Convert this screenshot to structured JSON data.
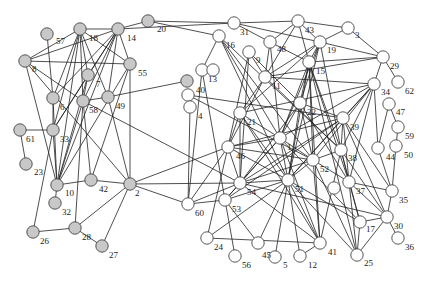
{
  "diagram": {
    "type": "network-graph",
    "colors": {
      "group_a": "#c8c8c8",
      "group_b": "#ffffff",
      "edge": "#222222"
    },
    "nodes": [
      {
        "id": "57",
        "x": 47,
        "y": 34,
        "group": "a",
        "lx": 56,
        "ly": 44
      },
      {
        "id": "18",
        "x": 80,
        "y": 29,
        "group": "a",
        "lx": 89,
        "ly": 41
      },
      {
        "id": "14",
        "x": 118,
        "y": 29,
        "group": "a",
        "lx": 127,
        "ly": 41
      },
      {
        "id": "20",
        "x": 148,
        "y": 21,
        "group": "a",
        "lx": 157,
        "ly": 32
      },
      {
        "id": "8",
        "x": 25,
        "y": 61,
        "group": "a",
        "lx": 32,
        "ly": 72
      },
      {
        "id": "55",
        "x": 130,
        "y": 64,
        "group": "a",
        "lx": 138,
        "ly": 76
      },
      {
        "id": "7",
        "x": 88,
        "y": 75,
        "group": "a",
        "lx": 96,
        "ly": 87
      },
      {
        "id": "6",
        "x": 53,
        "y": 98,
        "group": "a",
        "lx": 60,
        "ly": 110
      },
      {
        "id": "58",
        "x": 83,
        "y": 101,
        "group": "a",
        "lx": 89,
        "ly": 113
      },
      {
        "id": "49",
        "x": 108,
        "y": 97,
        "group": "a",
        "lx": 116,
        "ly": 109
      },
      {
        "id": "61",
        "x": 20,
        "y": 130,
        "group": "a",
        "lx": 26,
        "ly": 142
      },
      {
        "id": "33",
        "x": 53,
        "y": 130,
        "group": "a",
        "lx": 60,
        "ly": 142
      },
      {
        "id": "23",
        "x": 26,
        "y": 164,
        "group": "a",
        "lx": 34,
        "ly": 175
      },
      {
        "id": "10",
        "x": 57,
        "y": 185,
        "group": "a",
        "lx": 65,
        "ly": 196
      },
      {
        "id": "42",
        "x": 91,
        "y": 180,
        "group": "a",
        "lx": 99,
        "ly": 192
      },
      {
        "id": "2",
        "x": 130,
        "y": 184,
        "group": "a",
        "lx": 135,
        "ly": 196
      },
      {
        "id": "32",
        "x": 55,
        "y": 203,
        "group": "a",
        "lx": 62,
        "ly": 215
      },
      {
        "id": "26",
        "x": 33,
        "y": 232,
        "group": "a",
        "lx": 40,
        "ly": 244
      },
      {
        "id": "28",
        "x": 75,
        "y": 228,
        "group": "a",
        "lx": 82,
        "ly": 240
      },
      {
        "id": "27",
        "x": 102,
        "y": 246,
        "group": "a",
        "lx": 109,
        "ly": 258
      },
      {
        "id": "19b",
        "x": 187,
        "y": 81,
        "group": "a",
        "lx": 0,
        "ly": 0,
        "hidden_label": true
      },
      {
        "id": "31",
        "x": 234,
        "y": 23,
        "group": "b",
        "lx": 240,
        "ly": 35
      },
      {
        "id": "43",
        "x": 298,
        "y": 21,
        "group": "b",
        "lx": 305,
        "ly": 33
      },
      {
        "id": "3",
        "x": 348,
        "y": 28,
        "group": "b",
        "lx": 355,
        "ly": 38
      },
      {
        "id": "16",
        "x": 219,
        "y": 36,
        "group": "b",
        "lx": 226,
        "ly": 48
      },
      {
        "id": "48",
        "x": 270,
        "y": 42,
        "group": "b",
        "lx": 277,
        "ly": 52
      },
      {
        "id": "19",
        "x": 320,
        "y": 42,
        "group": "b",
        "lx": 327,
        "ly": 53
      },
      {
        "id": "9",
        "x": 249,
        "y": 52,
        "group": "b",
        "lx": 256,
        "ly": 63
      },
      {
        "id": "15",
        "x": 309,
        "y": 62,
        "group": "b",
        "lx": 316,
        "ly": 74
      },
      {
        "id": "29",
        "x": 383,
        "y": 57,
        "group": "b",
        "lx": 390,
        "ly": 69
      },
      {
        "id": "13",
        "x": 202,
        "y": 70,
        "group": "b",
        "lx": 208,
        "ly": 82
      },
      {
        "id": "11",
        "x": 265,
        "y": 77,
        "group": "b",
        "lx": 272,
        "ly": 89
      },
      {
        "id": "62",
        "x": 398,
        "y": 82,
        "group": "b",
        "lx": 405,
        "ly": 94
      },
      {
        "id": "40",
        "x": 188,
        "y": 95,
        "group": "b",
        "lx": 196,
        "ly": 93
      },
      {
        "id": "4",
        "x": 190,
        "y": 107,
        "group": "b",
        "lx": 198,
        "ly": 119
      },
      {
        "id": "34",
        "x": 374,
        "y": 84,
        "group": "b",
        "lx": 381,
        "ly": 95
      },
      {
        "id": "47",
        "x": 389,
        "y": 104,
        "group": "b",
        "lx": 396,
        "ly": 115
      },
      {
        "id": "21",
        "x": 240,
        "y": 113,
        "group": "b",
        "lx": 247,
        "ly": 125
      },
      {
        "id": "22",
        "x": 300,
        "y": 103,
        "group": "b",
        "lx": 307,
        "ly": 115
      },
      {
        "id": "39",
        "x": 343,
        "y": 118,
        "group": "b",
        "lx": 350,
        "ly": 130
      },
      {
        "id": "59",
        "x": 398,
        "y": 127,
        "group": "b",
        "lx": 405,
        "ly": 139
      },
      {
        "id": "1",
        "x": 280,
        "y": 138,
        "group": "b",
        "lx": 287,
        "ly": 150
      },
      {
        "id": "46",
        "x": 228,
        "y": 147,
        "group": "b",
        "lx": 236,
        "ly": 159
      },
      {
        "id": "38",
        "x": 341,
        "y": 150,
        "group": "b",
        "lx": 348,
        "ly": 161
      },
      {
        "id": "44",
        "x": 378,
        "y": 148,
        "group": "b",
        "lx": 386,
        "ly": 160
      },
      {
        "id": "50",
        "x": 396,
        "y": 146,
        "group": "b",
        "lx": 404,
        "ly": 158
      },
      {
        "id": "52",
        "x": 313,
        "y": 160,
        "group": "b",
        "lx": 320,
        "ly": 172
      },
      {
        "id": "54",
        "x": 240,
        "y": 183,
        "group": "b",
        "lx": 247,
        "ly": 195
      },
      {
        "id": "51",
        "x": 288,
        "y": 180,
        "group": "b",
        "lx": 295,
        "ly": 192
      },
      {
        "id": "37",
        "x": 349,
        "y": 182,
        "group": "b",
        "lx": 356,
        "ly": 194
      },
      {
        "id": "60",
        "x": 188,
        "y": 204,
        "group": "b",
        "lx": 195,
        "ly": 216
      },
      {
        "id": "53",
        "x": 225,
        "y": 200,
        "group": "b",
        "lx": 232,
        "ly": 212
      },
      {
        "id": "35",
        "x": 392,
        "y": 191,
        "group": "b",
        "lx": 399,
        "ly": 203
      },
      {
        "id": "17",
        "x": 360,
        "y": 222,
        "group": "b",
        "lx": 366,
        "ly": 232
      },
      {
        "id": "30",
        "x": 387,
        "y": 217,
        "group": "b",
        "lx": 394,
        "ly": 229
      },
      {
        "id": "24",
        "x": 207,
        "y": 238,
        "group": "b",
        "lx": 214,
        "ly": 250
      },
      {
        "id": "45",
        "x": 258,
        "y": 243,
        "group": "b",
        "lx": 262,
        "ly": 258
      },
      {
        "id": "41",
        "x": 320,
        "y": 243,
        "group": "b",
        "lx": 328,
        "ly": 255
      },
      {
        "id": "36",
        "x": 398,
        "y": 238,
        "group": "b",
        "lx": 405,
        "ly": 250
      },
      {
        "id": "56",
        "x": 235,
        "y": 256,
        "group": "b",
        "lx": 242,
        "ly": 268
      },
      {
        "id": "5",
        "x": 275,
        "y": 257,
        "group": "b",
        "lx": 283,
        "ly": 268
      },
      {
        "id": "12",
        "x": 300,
        "y": 256,
        "group": "b",
        "lx": 308,
        "ly": 268
      },
      {
        "id": "25",
        "x": 357,
        "y": 255,
        "group": "b",
        "lx": 364,
        "ly": 266
      },
      {
        "id": "empty1",
        "x": 213,
        "y": 70,
        "group": "b",
        "lx": 0,
        "ly": 0,
        "hidden_label": true
      },
      {
        "id": "empty2",
        "x": 334,
        "y": 188,
        "group": "b",
        "lx": 0,
        "ly": 0,
        "hidden_label": true
      }
    ],
    "edges": [
      [
        "18",
        "14"
      ],
      [
        "14",
        "20"
      ],
      [
        "20",
        "31"
      ],
      [
        "31",
        "43"
      ],
      [
        "43",
        "3"
      ],
      [
        "3",
        "29"
      ],
      [
        "29",
        "62"
      ],
      [
        "18",
        "8"
      ],
      [
        "18",
        "7"
      ],
      [
        "18",
        "6"
      ],
      [
        "18",
        "58"
      ],
      [
        "18",
        "33"
      ],
      [
        "18",
        "10"
      ],
      [
        "18",
        "55"
      ],
      [
        "18",
        "49"
      ],
      [
        "14",
        "7"
      ],
      [
        "14",
        "58"
      ],
      [
        "14",
        "33"
      ],
      [
        "14",
        "10"
      ],
      [
        "14",
        "55"
      ],
      [
        "14",
        "8"
      ],
      [
        "14",
        "6"
      ],
      [
        "14",
        "49"
      ],
      [
        "57",
        "6"
      ],
      [
        "8",
        "55"
      ],
      [
        "8",
        "58"
      ],
      [
        "8",
        "10"
      ],
      [
        "8",
        "2"
      ],
      [
        "55",
        "2"
      ],
      [
        "55",
        "42"
      ],
      [
        "55",
        "10"
      ],
      [
        "7",
        "58"
      ],
      [
        "7",
        "10"
      ],
      [
        "7",
        "33"
      ],
      [
        "6",
        "33"
      ],
      [
        "6",
        "10"
      ],
      [
        "58",
        "49"
      ],
      [
        "58",
        "10"
      ],
      [
        "58",
        "42"
      ],
      [
        "58",
        "54"
      ],
      [
        "49",
        "19b"
      ],
      [
        "49",
        "2"
      ],
      [
        "61",
        "33"
      ],
      [
        "33",
        "10"
      ],
      [
        "61",
        "23"
      ],
      [
        "10",
        "32"
      ],
      [
        "10",
        "42"
      ],
      [
        "42",
        "2"
      ],
      [
        "26",
        "28"
      ],
      [
        "28",
        "27"
      ],
      [
        "26",
        "33"
      ],
      [
        "28",
        "2"
      ],
      [
        "2",
        "27"
      ],
      [
        "28",
        "58"
      ],
      [
        "2",
        "46"
      ],
      [
        "2",
        "54"
      ],
      [
        "2",
        "60"
      ],
      [
        "20",
        "16"
      ],
      [
        "14",
        "31"
      ],
      [
        "31",
        "48"
      ],
      [
        "31",
        "19"
      ],
      [
        "43",
        "48"
      ],
      [
        "43",
        "11"
      ],
      [
        "43",
        "15"
      ],
      [
        "43",
        "19"
      ],
      [
        "3",
        "19"
      ],
      [
        "19",
        "29"
      ],
      [
        "19",
        "15"
      ],
      [
        "19",
        "1"
      ],
      [
        "19",
        "21"
      ],
      [
        "19",
        "22"
      ],
      [
        "19",
        "11"
      ],
      [
        "19",
        "51"
      ],
      [
        "19",
        "38"
      ],
      [
        "29",
        "34"
      ],
      [
        "29",
        "15"
      ],
      [
        "29",
        "11"
      ],
      [
        "16",
        "13"
      ],
      [
        "16",
        "51"
      ],
      [
        "16",
        "1"
      ],
      [
        "16",
        "52"
      ],
      [
        "16",
        "38"
      ],
      [
        "48",
        "11"
      ],
      [
        "48",
        "15"
      ],
      [
        "48",
        "1"
      ],
      [
        "9",
        "11"
      ],
      [
        "9",
        "46"
      ],
      [
        "9",
        "54"
      ],
      [
        "9",
        "22"
      ],
      [
        "15",
        "22"
      ],
      [
        "15",
        "1"
      ],
      [
        "15",
        "51"
      ],
      [
        "15",
        "52"
      ],
      [
        "15",
        "38"
      ],
      [
        "15",
        "37"
      ],
      [
        "15",
        "41"
      ],
      [
        "15",
        "25"
      ],
      [
        "13",
        "60"
      ],
      [
        "13",
        "53"
      ],
      [
        "40",
        "4"
      ],
      [
        "40",
        "39"
      ],
      [
        "40",
        "52"
      ],
      [
        "4",
        "60"
      ],
      [
        "11",
        "21"
      ],
      [
        "11",
        "46"
      ],
      [
        "11",
        "38"
      ],
      [
        "11",
        "34"
      ],
      [
        "34",
        "39"
      ],
      [
        "34",
        "38"
      ],
      [
        "34",
        "44"
      ],
      [
        "34",
        "52"
      ],
      [
        "34",
        "51"
      ],
      [
        "34",
        "1"
      ],
      [
        "34",
        "21"
      ],
      [
        "34",
        "37"
      ],
      [
        "47",
        "59"
      ],
      [
        "47",
        "44"
      ],
      [
        "59",
        "50"
      ],
      [
        "44",
        "35"
      ],
      [
        "50",
        "35"
      ],
      [
        "21",
        "1"
      ],
      [
        "21",
        "46"
      ],
      [
        "21",
        "51"
      ],
      [
        "21",
        "54"
      ],
      [
        "21",
        "41"
      ],
      [
        "22",
        "1"
      ],
      [
        "22",
        "39"
      ],
      [
        "22",
        "52"
      ],
      [
        "22",
        "51"
      ],
      [
        "22",
        "37"
      ],
      [
        "22",
        "54"
      ],
      [
        "39",
        "38"
      ],
      [
        "39",
        "37"
      ],
      [
        "39",
        "46"
      ],
      [
        "39",
        "51"
      ],
      [
        "39",
        "54"
      ],
      [
        "39",
        "53"
      ],
      [
        "39",
        "35"
      ],
      [
        "39",
        "30"
      ],
      [
        "1",
        "46"
      ],
      [
        "1",
        "52"
      ],
      [
        "1",
        "51"
      ],
      [
        "1",
        "54"
      ],
      [
        "1",
        "53"
      ],
      [
        "1",
        "41"
      ],
      [
        "1",
        "17"
      ],
      [
        "46",
        "54"
      ],
      [
        "46",
        "52"
      ],
      [
        "46",
        "60"
      ],
      [
        "46",
        "24"
      ],
      [
        "46",
        "51"
      ],
      [
        "38",
        "52"
      ],
      [
        "38",
        "37"
      ],
      [
        "38",
        "41"
      ],
      [
        "38",
        "30"
      ],
      [
        "38",
        "17"
      ],
      [
        "52",
        "51"
      ],
      [
        "52",
        "37"
      ],
      [
        "52",
        "54"
      ],
      [
        "52",
        "41"
      ],
      [
        "52",
        "25"
      ],
      [
        "54",
        "51"
      ],
      [
        "54",
        "53"
      ],
      [
        "54",
        "41"
      ],
      [
        "54",
        "60"
      ],
      [
        "54",
        "30"
      ],
      [
        "51",
        "53"
      ],
      [
        "51",
        "41"
      ],
      [
        "51",
        "12"
      ],
      [
        "51",
        "25"
      ],
      [
        "51",
        "24"
      ],
      [
        "51",
        "17"
      ],
      [
        "51",
        "45"
      ],
      [
        "37",
        "17"
      ],
      [
        "37",
        "30"
      ],
      [
        "37",
        "25"
      ],
      [
        "37",
        "35"
      ],
      [
        "53",
        "56"
      ],
      [
        "53",
        "45"
      ],
      [
        "53",
        "60"
      ],
      [
        "30",
        "36"
      ],
      [
        "30",
        "17"
      ],
      [
        "30",
        "25"
      ],
      [
        "17",
        "25"
      ],
      [
        "41",
        "24"
      ],
      [
        "35",
        "30"
      ],
      [
        "12",
        "41"
      ],
      [
        "5",
        "51"
      ]
    ]
  }
}
